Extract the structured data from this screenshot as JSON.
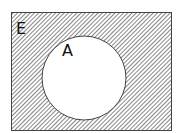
{
  "diagram": {
    "type": "venn",
    "universal_set": {
      "label": "E",
      "shaded": true
    },
    "sets": [
      {
        "label": "A",
        "shaded": false
      }
    ],
    "shaded_region": "complement of A (E minus A)",
    "colors": {
      "hatch": "#555555",
      "border": "#444444",
      "background": "#ffffff"
    }
  }
}
